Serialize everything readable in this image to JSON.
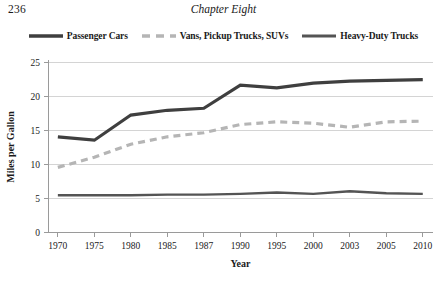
{
  "page": {
    "folio": "236",
    "running_head": "Chapter Eight"
  },
  "legend": {
    "items": [
      {
        "label": "Passenger Cars",
        "color": "#3f3f3f",
        "style": "solid",
        "width": 3.2
      },
      {
        "label": "Vans, Pickup Trucks, SUVs",
        "color": "#b5b5b5",
        "style": "dashed",
        "width": 3.2
      },
      {
        "label": "Heavy-Duty Trucks",
        "color": "#545454",
        "style": "solid",
        "width": 2.4
      }
    ]
  },
  "chart_data": {
    "type": "line",
    "title": "",
    "xlabel": "Year",
    "ylabel": "Miles per Gallon",
    "categories": [
      "1970",
      "1975",
      "1980",
      "1985",
      "1987",
      "1990",
      "1995",
      "2000",
      "2003",
      "2005",
      "2010"
    ],
    "yticks": [
      "0",
      "5",
      "10",
      "15",
      "20",
      "25"
    ],
    "ylim": [
      0,
      25
    ],
    "grid": true,
    "legend_position": "top",
    "series": [
      {
        "name": "Passenger Cars",
        "color": "#3f3f3f",
        "style": "solid",
        "values": [
          14.0,
          13.5,
          17.2,
          17.9,
          18.2,
          21.6,
          21.2,
          21.9,
          22.2,
          22.3,
          22.4
        ]
      },
      {
        "name": "Vans, Pickup Trucks, SUVs",
        "color": "#b5b5b5",
        "style": "dashed",
        "values": [
          9.5,
          11.0,
          12.9,
          14.0,
          14.6,
          15.8,
          16.2,
          16.0,
          15.4,
          16.2,
          16.3
        ]
      },
      {
        "name": "Heavy-Duty Trucks",
        "color": "#545454",
        "style": "solid",
        "values": [
          5.4,
          5.4,
          5.4,
          5.5,
          5.5,
          5.6,
          5.8,
          5.6,
          6.0,
          5.7,
          5.6
        ]
      }
    ]
  }
}
